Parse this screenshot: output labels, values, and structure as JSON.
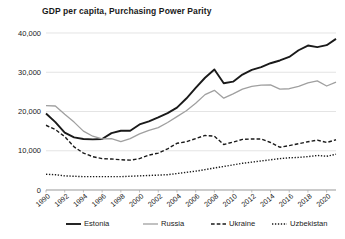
{
  "chart_data": {
    "type": "line",
    "title": "GDP per capita, Purchasing Power Parity",
    "xlabel": "",
    "ylabel": "",
    "grid": "horizontal",
    "legend_position": "bottom",
    "xlim": [
      1990,
      2021
    ],
    "ylim": [
      0,
      40000
    ],
    "yticks": [
      0,
      10000,
      20000,
      30000,
      40000
    ],
    "ytick_labels": [
      "0",
      "10,000",
      "20,000",
      "30,000",
      "40,000"
    ],
    "xticks": [
      1990,
      1992,
      1994,
      1996,
      1998,
      2000,
      2002,
      2004,
      2006,
      2008,
      2010,
      2012,
      2014,
      2016,
      2018,
      2020
    ],
    "xtick_labels": [
      "1990",
      "1992",
      "1994",
      "1996",
      "1998",
      "2000",
      "2002",
      "2004",
      "2006",
      "2008",
      "2010",
      "2012",
      "2014",
      "2016",
      "2018",
      "2020"
    ],
    "x": [
      1990,
      1991,
      1992,
      1993,
      1994,
      1995,
      1996,
      1997,
      1998,
      1999,
      2000,
      2001,
      2002,
      2003,
      2004,
      2005,
      2006,
      2007,
      2008,
      2009,
      2010,
      2011,
      2012,
      2013,
      2014,
      2015,
      2016,
      2017,
      2018,
      2019,
      2020,
      2021
    ],
    "series": [
      {
        "name": "Estonia",
        "color": "#1a1a1a",
        "style": "solid",
        "width": 1.9,
        "values": [
          19500,
          17300,
          14600,
          13400,
          13000,
          12900,
          13000,
          14500,
          15100,
          15100,
          16700,
          17500,
          18500,
          19600,
          21000,
          23300,
          26000,
          28600,
          30700,
          27200,
          27600,
          29400,
          30600,
          31300,
          32300,
          33000,
          33900,
          35600,
          36800,
          36400,
          36900,
          38500
        ]
      },
      {
        "name": "Russia",
        "color": "#a0a0a0",
        "style": "solid",
        "width": 1.3,
        "values": [
          21500,
          21400,
          19300,
          17300,
          15000,
          13700,
          13000,
          13100,
          12300,
          13100,
          14300,
          15200,
          15900,
          17200,
          18700,
          20200,
          22100,
          24300,
          25400,
          23400,
          24500,
          25700,
          26400,
          26700,
          26800,
          25700,
          25800,
          26400,
          27300,
          27800,
          26500,
          27500
        ]
      },
      {
        "name": "Ukraine",
        "color": "#1a1a1a",
        "style": "dashed",
        "width": 1.4,
        "values": [
          16500,
          15400,
          13600,
          11000,
          9400,
          8500,
          8000,
          7900,
          7700,
          7600,
          8000,
          8900,
          9400,
          10500,
          11900,
          12300,
          13100,
          13900,
          13700,
          11600,
          12200,
          12900,
          13000,
          13000,
          12100,
          10900,
          11300,
          11800,
          12300,
          12700,
          12100,
          12800
        ]
      },
      {
        "name": "Uzbekistan",
        "color": "#1a1a1a",
        "style": "dotted",
        "width": 1.4,
        "values": [
          4000,
          3900,
          3600,
          3500,
          3400,
          3400,
          3400,
          3400,
          3400,
          3500,
          3600,
          3700,
          3800,
          3900,
          4200,
          4500,
          4800,
          5200,
          5600,
          6000,
          6400,
          6800,
          7100,
          7400,
          7700,
          8000,
          8200,
          8300,
          8500,
          8800,
          8600,
          9100
        ]
      }
    ]
  },
  "legend": {
    "items": [
      {
        "label": "Estonia"
      },
      {
        "label": "Russia"
      },
      {
        "label": "Ukraine"
      },
      {
        "label": "Uzbekistan"
      }
    ]
  }
}
